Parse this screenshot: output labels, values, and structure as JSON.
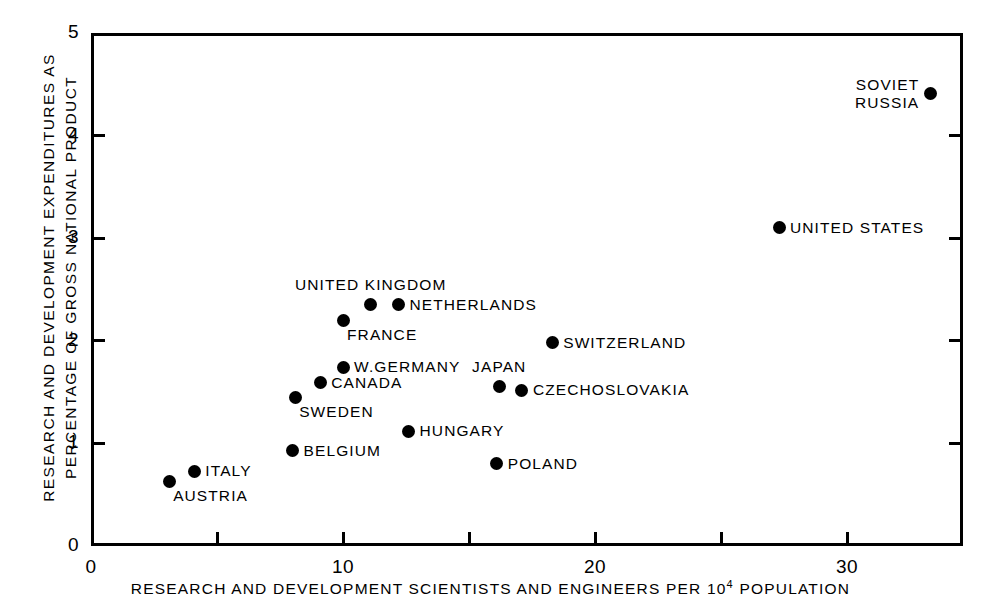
{
  "chart_data": {
    "type": "scatter",
    "title": "",
    "xlabel": "RESEARCH AND DEVELOPMENT SCIENTISTS AND ENGINEERS PER 10⁴ POPULATION",
    "ylabel_line1": "RESEARCH AND DEVELOPMENT EXPENDITURES AS",
    "ylabel_line2": "PERCENTAGE OF GROSS NATIONAL PRODUCT",
    "xlim": [
      0,
      34.6
    ],
    "ylim": [
      0,
      5
    ],
    "xticks": [
      0,
      5,
      10,
      15,
      20,
      25,
      30
    ],
    "xtick_labels": [
      "0",
      "",
      "10",
      "",
      "20",
      "",
      "30"
    ],
    "yticks": [
      0,
      1,
      2,
      3,
      4,
      5
    ],
    "ytick_labels": [
      "0",
      "1",
      "2",
      "3",
      "4",
      "5"
    ],
    "grid": false,
    "legend": "none",
    "marker": "filled-circle",
    "marker_color": "#000000",
    "points": [
      {
        "name": "SOVIET RUSSIA",
        "x": 33.3,
        "y": 4.41,
        "label_lines": [
          "SOVIET",
          "RUSSIA"
        ],
        "label_pos": "left"
      },
      {
        "name": "UNITED STATES",
        "x": 27.3,
        "y": 3.1,
        "label_lines": [
          "UNITED STATES"
        ],
        "label_pos": "right"
      },
      {
        "name": "UNITED KINGDOM",
        "x": 11.1,
        "y": 2.35,
        "label_lines": [
          "UNITED KINGDOM"
        ],
        "label_pos": "above"
      },
      {
        "name": "NETHERLANDS",
        "x": 12.2,
        "y": 2.35,
        "label_lines": [
          "NETHERLANDS"
        ],
        "label_pos": "right"
      },
      {
        "name": "FRANCE",
        "x": 10.0,
        "y": 2.2,
        "label_lines": [
          "FRANCE"
        ],
        "label_pos": "below-right"
      },
      {
        "name": "SWITZERLAND",
        "x": 18.3,
        "y": 1.98,
        "label_lines": [
          "SWITZERLAND"
        ],
        "label_pos": "right"
      },
      {
        "name": "W.GERMANY",
        "x": 10.0,
        "y": 1.74,
        "label_lines": [
          "W.GERMANY"
        ],
        "label_pos": "right"
      },
      {
        "name": "CANADA",
        "x": 9.1,
        "y": 1.59,
        "label_lines": [
          "CANADA"
        ],
        "label_pos": "right"
      },
      {
        "name": "JAPAN",
        "x": 16.2,
        "y": 1.55,
        "label_lines": [
          "JAPAN"
        ],
        "label_pos": "above"
      },
      {
        "name": "CZECHOSLOVAKIA",
        "x": 17.1,
        "y": 1.52,
        "label_lines": [
          "CZECHOSLOVAKIA"
        ],
        "label_pos": "right"
      },
      {
        "name": "SWEDEN",
        "x": 8.1,
        "y": 1.45,
        "label_lines": [
          "SWEDEN"
        ],
        "label_pos": "below-right"
      },
      {
        "name": "HUNGARY",
        "x": 12.6,
        "y": 1.12,
        "label_lines": [
          "HUNGARY"
        ],
        "label_pos": "right"
      },
      {
        "name": "BELGIUM",
        "x": 8.0,
        "y": 0.93,
        "label_lines": [
          "BELGIUM"
        ],
        "label_pos": "right"
      },
      {
        "name": "POLAND",
        "x": 16.1,
        "y": 0.8,
        "label_lines": [
          "POLAND"
        ],
        "label_pos": "right"
      },
      {
        "name": "ITALY",
        "x": 4.1,
        "y": 0.73,
        "label_lines": [
          "ITALY"
        ],
        "label_pos": "right"
      },
      {
        "name": "AUSTRIA",
        "x": 3.1,
        "y": 0.63,
        "label_lines": [
          "AUSTRIA"
        ],
        "label_pos": "below-right"
      }
    ]
  },
  "axes": {
    "x_title": "RESEARCH AND DEVELOPMENT SCIENTISTS AND ENGINEERS PER 10",
    "x_title_sup": "4",
    "x_title_tail": " POPULATION",
    "y_title_line1": "RESEARCH AND DEVELOPMENT EXPENDITURES AS",
    "y_title_line2": "PERCENTAGE OF GROSS NATIONAL PRODUCT"
  }
}
